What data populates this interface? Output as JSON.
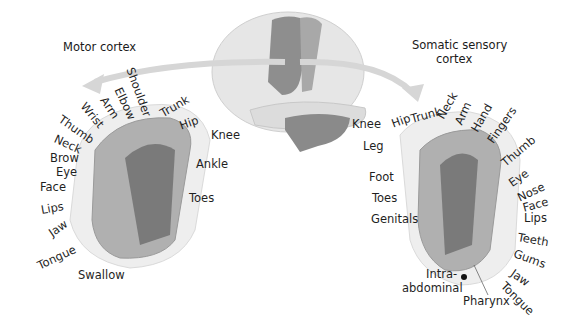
{
  "diagram": {
    "motor": {
      "title": "Motor cortex",
      "labels": [
        "Shoulder",
        "Elbow",
        "Arm",
        "Wrist",
        "Thumb",
        "Neck",
        "Brow",
        "Eye",
        "Face",
        "Lips",
        "Jaw",
        "Tongue",
        "Swallow",
        "Trunk",
        "Hip",
        "Knee",
        "Ankle",
        "Toes"
      ]
    },
    "sensory": {
      "title_line1": "Somatic sensory",
      "title_line2": "cortex",
      "labels": [
        "Knee",
        "Hip",
        "Trunk",
        "Neck",
        "Arm",
        "Hand",
        "Fingers",
        "Thumb",
        "Leg",
        "Foot",
        "Toes",
        "Genitals",
        "Eye",
        "Nose",
        "Face",
        "Lips",
        "Teeth",
        "Gums",
        "Jaw",
        "Tongue",
        "Intra-",
        "abdominal",
        "Pharynx"
      ]
    },
    "colors": {
      "brain_light": "#e4e4e4",
      "cortex_band_dark": "#8a8a8a",
      "cortex_band_mid": "#a9a9a9",
      "cerebellum": "#8e8e8e",
      "fold_light": "#c9c9c9",
      "arrow": "#d8d8d8"
    }
  }
}
